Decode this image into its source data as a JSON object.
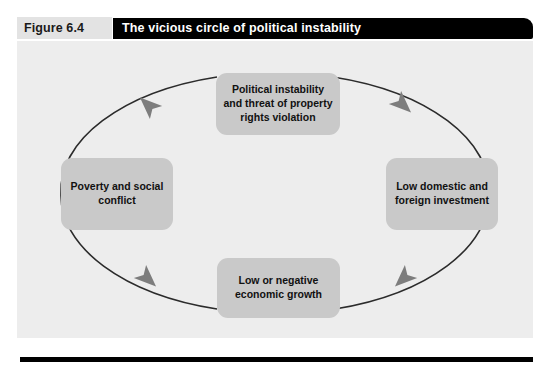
{
  "figure": {
    "label": "Figure 6.4",
    "title": "The vicious circle of political instability"
  },
  "diagram": {
    "type": "cycle",
    "direction": "clockwise",
    "node_count": 4,
    "arrow_count": 4,
    "nodes": [
      {
        "id": "instability",
        "position": "top",
        "label": "Political instability and threat of property rights violation"
      },
      {
        "id": "investment",
        "position": "right",
        "label": "Low domestic and foreign investment"
      },
      {
        "id": "growth",
        "position": "bottom",
        "label": "Low or negative economic growth"
      },
      {
        "id": "poverty",
        "position": "left",
        "label": "Poverty and social conflict"
      }
    ],
    "edges": [
      {
        "from": "instability",
        "to": "investment",
        "arrow": "arrowhead-top-right"
      },
      {
        "from": "investment",
        "to": "growth",
        "arrow": "arrowhead-bottom-right"
      },
      {
        "from": "growth",
        "to": "poverty",
        "arrow": "arrowhead-bottom-left"
      },
      {
        "from": "poverty",
        "to": "instability",
        "arrow": "arrowhead-top-left"
      }
    ]
  },
  "colors": {
    "title_bar": "#000000",
    "title_text": "#ffffff",
    "label_band": "#e3e3e3",
    "panel_background": "#ededed",
    "node_fill": "#c9c9c9",
    "node_text": "#111111",
    "arrow_line": "#2b2b2b",
    "arrow_head": "#7d7d7d",
    "bottom_rule": "#000000"
  }
}
